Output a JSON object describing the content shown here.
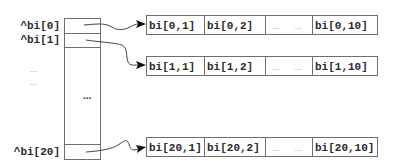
{
  "diagram": {
    "type": "array-of-pointers",
    "pointer_labels": [
      "^bi[0]",
      "^bi[1]",
      "^bi[20]"
    ],
    "left_ellipses": [
      "...",
      "..."
    ],
    "column_ellipsis": "...",
    "rows": [
      {
        "pointer": "^bi[0]",
        "cells": [
          "bi[0,1]",
          "bi[0,2]",
          "...   ...",
          "bi[0,10]"
        ]
      },
      {
        "pointer": "^bi[1]",
        "cells": [
          "bi[1,1]",
          "bi[1,2]",
          "...   ...",
          "bi[1,10]"
        ]
      },
      {
        "pointer": "^bi[20]",
        "cells": [
          "bi[20,1]",
          "bi[20,2]",
          "...   ...",
          "bi[20,10]"
        ]
      }
    ],
    "colors": {
      "stroke": "#6e6e6e",
      "text": "#2a2a2a",
      "arrowhead": "#111111",
      "background": "#ffffff"
    }
  }
}
